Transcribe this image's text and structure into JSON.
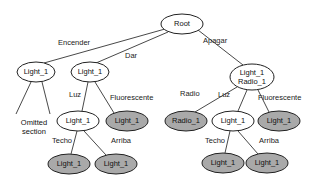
{
  "diagram": {
    "type": "tree",
    "nodes": [
      {
        "id": "root",
        "lines": [
          "Root"
        ],
        "style": "white",
        "cx": 182,
        "cy": 24,
        "rx": 21,
        "ry": 10
      },
      {
        "id": "n_enc",
        "lines": [
          "Light_1"
        ],
        "style": "white",
        "cx": 36,
        "cy": 72,
        "rx": 19,
        "ry": 10
      },
      {
        "id": "n_dar",
        "lines": [
          "Light_1"
        ],
        "style": "white",
        "cx": 90,
        "cy": 72,
        "rx": 19,
        "ry": 10
      },
      {
        "id": "n_apa",
        "lines": [
          "Light_1",
          "Radio_1"
        ],
        "style": "white",
        "cx": 252,
        "cy": 77,
        "rx": 22,
        "ry": 13
      },
      {
        "id": "n_dar_luz",
        "lines": [
          "Light_1"
        ],
        "style": "white",
        "cx": 78,
        "cy": 121,
        "rx": 21,
        "ry": 10
      },
      {
        "id": "n_dar_flu",
        "lines": [
          "Light_1"
        ],
        "style": "gray",
        "cx": 127,
        "cy": 121,
        "rx": 21,
        "ry": 10
      },
      {
        "id": "n_dar_techo",
        "lines": [
          "Light_1"
        ],
        "style": "gray",
        "cx": 69,
        "cy": 164,
        "rx": 21,
        "ry": 10
      },
      {
        "id": "n_dar_arriba",
        "lines": [
          "Light_1"
        ],
        "style": "gray",
        "cx": 116,
        "cy": 164,
        "rx": 21,
        "ry": 10
      },
      {
        "id": "n_apa_radio",
        "lines": [
          "Radio_1"
        ],
        "style": "gray",
        "cx": 186,
        "cy": 121,
        "rx": 21,
        "ry": 10
      },
      {
        "id": "n_apa_luz",
        "lines": [
          "Light_1"
        ],
        "style": "white",
        "cx": 233,
        "cy": 121,
        "rx": 21,
        "ry": 10
      },
      {
        "id": "n_apa_flu",
        "lines": [
          "Light_1"
        ],
        "style": "gray",
        "cx": 279,
        "cy": 121,
        "rx": 21,
        "ry": 10
      },
      {
        "id": "n_apa_techo",
        "lines": [
          "Light_1"
        ],
        "style": "gray",
        "cx": 223,
        "cy": 163,
        "rx": 21,
        "ry": 10
      },
      {
        "id": "n_apa_arriba",
        "lines": [
          "Light_1"
        ],
        "style": "gray",
        "cx": 267,
        "cy": 163,
        "rx": 21,
        "ry": 10
      }
    ],
    "edges": [
      {
        "from": "root",
        "to": "n_enc",
        "label": "Encender",
        "lx": 58,
        "ly": 45,
        "x1": 165,
        "y1": 29,
        "x2": 44,
        "y2": 63
      },
      {
        "from": "root",
        "to": "n_dar",
        "label": "Dar",
        "lx": 125,
        "ly": 58,
        "x1": 168,
        "y1": 32,
        "x2": 96,
        "y2": 63
      },
      {
        "from": "root",
        "to": "n_apa",
        "label": "Apagar",
        "lx": 203,
        "ly": 43,
        "x1": 198,
        "y1": 30,
        "x2": 243,
        "y2": 65
      },
      {
        "from": "n_enc",
        "to": "omitted",
        "label": "",
        "x1": 31,
        "y1": 82,
        "x2": 16,
        "y2": 114
      },
      {
        "from": "n_enc",
        "to": "omitted",
        "label": "",
        "x1": 42,
        "y1": 82,
        "x2": 50,
        "y2": 114
      },
      {
        "from": "n_dar",
        "to": "n_dar_luz",
        "label": "Luz",
        "lx": 69,
        "ly": 97,
        "x1": 88,
        "y1": 82,
        "x2": 82,
        "y2": 111
      },
      {
        "from": "n_dar",
        "to": "n_dar_flu",
        "label": "Fluorescente",
        "lx": 110,
        "ly": 100,
        "x1": 95,
        "y1": 82,
        "x2": 114,
        "y2": 113
      },
      {
        "from": "n_dar_luz",
        "to": "n_dar_techo",
        "label": "Techo",
        "lx": 52,
        "ly": 143,
        "x1": 77,
        "y1": 131,
        "x2": 71,
        "y2": 154
      },
      {
        "from": "n_dar_luz",
        "to": "n_dar_arriba",
        "label": "Arriba",
        "lx": 111,
        "ly": 143,
        "x1": 84,
        "y1": 131,
        "x2": 106,
        "y2": 155
      },
      {
        "from": "n_apa",
        "to": "n_apa_radio",
        "label": "Radio",
        "lx": 180,
        "ly": 96,
        "x1": 237,
        "y1": 87,
        "x2": 195,
        "y2": 112
      },
      {
        "from": "n_apa",
        "to": "n_apa_luz",
        "label": "Luz",
        "lx": 218,
        "ly": 97,
        "x1": 247,
        "y1": 90,
        "x2": 238,
        "y2": 111
      },
      {
        "from": "n_apa",
        "to": "n_apa_flu",
        "label": "Fluorescente",
        "lx": 258,
        "ly": 100,
        "x1": 258,
        "y1": 90,
        "x2": 269,
        "y2": 112
      },
      {
        "from": "n_apa_luz",
        "to": "n_apa_techo",
        "label": "Techo",
        "lx": 205,
        "ly": 143,
        "x1": 230,
        "y1": 131,
        "x2": 225,
        "y2": 153
      },
      {
        "from": "n_apa_luz",
        "to": "n_apa_arriba",
        "label": "Arriba",
        "lx": 259,
        "ly": 143,
        "x1": 238,
        "y1": 131,
        "x2": 258,
        "y2": 154
      }
    ],
    "annotations": [
      {
        "id": "omitted",
        "lines": [
          "Omitted",
          "section"
        ],
        "x": 34,
        "y": 123
      }
    ]
  }
}
